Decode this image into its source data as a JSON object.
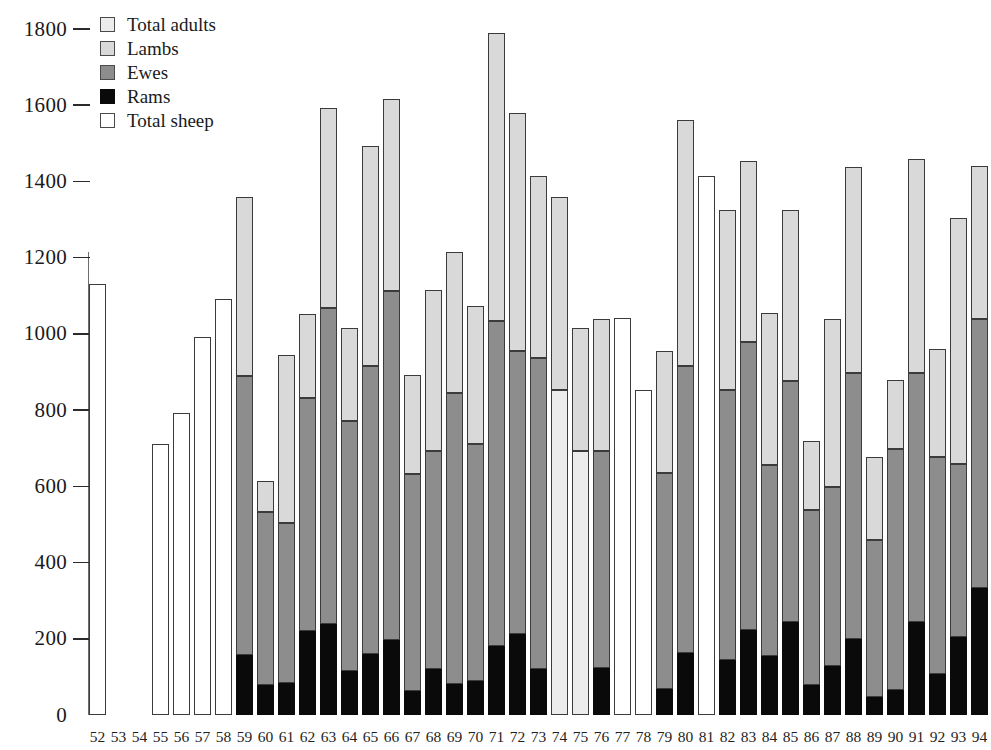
{
  "chart_data": {
    "type": "bar",
    "title": "",
    "subtitle": "",
    "xlabel": "",
    "ylabel": "",
    "ylim": [
      0,
      1800
    ],
    "ytick_step": 200,
    "yticks": [
      0,
      200,
      400,
      600,
      800,
      1000,
      1200,
      1400,
      1600,
      1800
    ],
    "ytick_labels": [
      "0",
      "200",
      "400",
      "600",
      "800",
      "1000",
      "1200",
      "1400",
      "1600",
      "1800"
    ],
    "grid": false,
    "stacked": true,
    "legend_position": "top-left",
    "legend": [
      {
        "key": "adults",
        "label": "Total adults",
        "color": "#ececec"
      },
      {
        "key": "lambs",
        "label": "Lambs",
        "color": "#d9d9d9"
      },
      {
        "key": "ewes",
        "label": "Ewes",
        "color": "#8d8d8d"
      },
      {
        "key": "rams",
        "label": "Rams",
        "color": "#0a0a0a"
      },
      {
        "key": "total",
        "label": "Total sheep",
        "color": "#ffffff"
      }
    ],
    "categories": [
      "52",
      "53",
      "54",
      "55",
      "56",
      "57",
      "58",
      "59",
      "60",
      "61",
      "62",
      "63",
      "64",
      "65",
      "66",
      "67",
      "68",
      "69",
      "70",
      "71",
      "72",
      "73",
      "74",
      "75",
      "76",
      "77",
      "78",
      "79",
      "80",
      "81",
      "82",
      "83",
      "84",
      "85",
      "86",
      "87",
      "88",
      "89",
      "90",
      "91",
      "92",
      "93",
      "94"
    ],
    "bars": [
      {
        "category": "52",
        "kind": "total",
        "segments": [
          {
            "key": "total",
            "from": 0,
            "to": 1130
          }
        ],
        "total": 1130
      },
      {
        "category": "53",
        "kind": "empty",
        "segments": [],
        "total": 0
      },
      {
        "category": "54",
        "kind": "empty",
        "segments": [],
        "total": 0
      },
      {
        "category": "55",
        "kind": "total",
        "segments": [
          {
            "key": "total",
            "from": 0,
            "to": 712
          }
        ],
        "total": 712
      },
      {
        "category": "56",
        "kind": "total",
        "segments": [
          {
            "key": "total",
            "from": 0,
            "to": 792
          }
        ],
        "total": 792
      },
      {
        "category": "57",
        "kind": "total",
        "segments": [
          {
            "key": "total",
            "from": 0,
            "to": 992
          }
        ],
        "total": 992
      },
      {
        "category": "58",
        "kind": "total",
        "segments": [
          {
            "key": "total",
            "from": 0,
            "to": 1092
          }
        ],
        "total": 1092
      },
      {
        "category": "59",
        "kind": "stacked",
        "segments": [
          {
            "key": "rams",
            "from": 0,
            "to": 158
          },
          {
            "key": "ewes",
            "from": 158,
            "to": 890
          },
          {
            "key": "lambs",
            "from": 890,
            "to": 1358
          }
        ],
        "total": 1358
      },
      {
        "category": "60",
        "kind": "stacked",
        "segments": [
          {
            "key": "rams",
            "from": 0,
            "to": 80
          },
          {
            "key": "ewes",
            "from": 80,
            "to": 532
          },
          {
            "key": "lambs",
            "from": 532,
            "to": 614
          }
        ],
        "total": 614
      },
      {
        "category": "61",
        "kind": "stacked",
        "segments": [
          {
            "key": "rams",
            "from": 0,
            "to": 84
          },
          {
            "key": "ewes",
            "from": 84,
            "to": 504
          },
          {
            "key": "lambs",
            "from": 504,
            "to": 944
          }
        ],
        "total": 944
      },
      {
        "category": "62",
        "kind": "stacked",
        "segments": [
          {
            "key": "rams",
            "from": 0,
            "to": 220
          },
          {
            "key": "ewes",
            "from": 220,
            "to": 832
          },
          {
            "key": "lambs",
            "from": 832,
            "to": 1052
          }
        ],
        "total": 1052
      },
      {
        "category": "63",
        "kind": "stacked",
        "segments": [
          {
            "key": "rams",
            "from": 0,
            "to": 240
          },
          {
            "key": "ewes",
            "from": 240,
            "to": 1068
          },
          {
            "key": "lambs",
            "from": 1068,
            "to": 1594
          }
        ],
        "total": 1594
      },
      {
        "category": "64",
        "kind": "stacked",
        "segments": [
          {
            "key": "rams",
            "from": 0,
            "to": 116
          },
          {
            "key": "ewes",
            "from": 116,
            "to": 772
          },
          {
            "key": "lambs",
            "from": 772,
            "to": 1016
          }
        ],
        "total": 1016
      },
      {
        "category": "65",
        "kind": "stacked",
        "segments": [
          {
            "key": "rams",
            "from": 0,
            "to": 160
          },
          {
            "key": "ewes",
            "from": 160,
            "to": 916
          },
          {
            "key": "lambs",
            "from": 916,
            "to": 1492
          }
        ],
        "total": 1492
      },
      {
        "category": "66",
        "kind": "stacked",
        "segments": [
          {
            "key": "rams",
            "from": 0,
            "to": 198
          },
          {
            "key": "ewes",
            "from": 198,
            "to": 1112
          },
          {
            "key": "lambs",
            "from": 1112,
            "to": 1616
          }
        ],
        "total": 1616
      },
      {
        "category": "67",
        "kind": "stacked",
        "segments": [
          {
            "key": "rams",
            "from": 0,
            "to": 64
          },
          {
            "key": "ewes",
            "from": 64,
            "to": 632
          },
          {
            "key": "lambs",
            "from": 632,
            "to": 892
          }
        ],
        "total": 892
      },
      {
        "category": "68",
        "kind": "stacked",
        "segments": [
          {
            "key": "rams",
            "from": 0,
            "to": 120
          },
          {
            "key": "ewes",
            "from": 120,
            "to": 694
          },
          {
            "key": "lambs",
            "from": 694,
            "to": 1116
          }
        ],
        "total": 1116
      },
      {
        "category": "69",
        "kind": "stacked",
        "segments": [
          {
            "key": "rams",
            "from": 0,
            "to": 82
          },
          {
            "key": "ewes",
            "from": 82,
            "to": 844
          },
          {
            "key": "lambs",
            "from": 844,
            "to": 1216
          }
        ],
        "total": 1216
      },
      {
        "category": "70",
        "kind": "stacked",
        "segments": [
          {
            "key": "rams",
            "from": 0,
            "to": 88
          },
          {
            "key": "ewes",
            "from": 88,
            "to": 712
          },
          {
            "key": "lambs",
            "from": 712,
            "to": 1074
          }
        ],
        "total": 1074
      },
      {
        "category": "71",
        "kind": "stacked",
        "segments": [
          {
            "key": "rams",
            "from": 0,
            "to": 180
          },
          {
            "key": "ewes",
            "from": 180,
            "to": 1034
          },
          {
            "key": "lambs",
            "from": 1034,
            "to": 1790
          }
        ],
        "total": 1790
      },
      {
        "category": "72",
        "kind": "stacked",
        "segments": [
          {
            "key": "rams",
            "from": 0,
            "to": 212
          },
          {
            "key": "ewes",
            "from": 212,
            "to": 956
          },
          {
            "key": "lambs",
            "from": 956,
            "to": 1580
          }
        ],
        "total": 1580
      },
      {
        "category": "73",
        "kind": "stacked",
        "segments": [
          {
            "key": "rams",
            "from": 0,
            "to": 122
          },
          {
            "key": "ewes",
            "from": 122,
            "to": 936
          },
          {
            "key": "lambs",
            "from": 936,
            "to": 1414
          }
        ],
        "total": 1414
      },
      {
        "category": "74",
        "kind": "stacked",
        "segments": [
          {
            "key": "adults",
            "from": 0,
            "to": 854
          },
          {
            "key": "lambs",
            "from": 854,
            "to": 1360
          }
        ],
        "total": 1360
      },
      {
        "category": "75",
        "kind": "stacked",
        "segments": [
          {
            "key": "adults",
            "from": 0,
            "to": 694
          },
          {
            "key": "lambs",
            "from": 694,
            "to": 1016
          }
        ],
        "total": 1016
      },
      {
        "category": "76",
        "kind": "stacked",
        "segments": [
          {
            "key": "rams",
            "from": 0,
            "to": 124
          },
          {
            "key": "ewes",
            "from": 124,
            "to": 694
          },
          {
            "key": "lambs",
            "from": 694,
            "to": 1038
          }
        ],
        "total": 1038
      },
      {
        "category": "77",
        "kind": "total",
        "segments": [
          {
            "key": "total",
            "from": 0,
            "to": 1042
          }
        ],
        "total": 1042
      },
      {
        "category": "78",
        "kind": "total",
        "segments": [
          {
            "key": "total",
            "from": 0,
            "to": 854
          }
        ],
        "total": 854
      },
      {
        "category": "79",
        "kind": "stacked",
        "segments": [
          {
            "key": "rams",
            "from": 0,
            "to": 68
          },
          {
            "key": "ewes",
            "from": 68,
            "to": 634
          },
          {
            "key": "lambs",
            "from": 634,
            "to": 956
          }
        ],
        "total": 956
      },
      {
        "category": "80",
        "kind": "stacked",
        "segments": [
          {
            "key": "rams",
            "from": 0,
            "to": 164
          },
          {
            "key": "ewes",
            "from": 164,
            "to": 916
          },
          {
            "key": "lambs",
            "from": 916,
            "to": 1560
          }
        ],
        "total": 1560
      },
      {
        "category": "81",
        "kind": "total",
        "segments": [
          {
            "key": "total",
            "from": 0,
            "to": 1414
          }
        ],
        "total": 1414
      },
      {
        "category": "82",
        "kind": "stacked",
        "segments": [
          {
            "key": "rams",
            "from": 0,
            "to": 144
          },
          {
            "key": "ewes",
            "from": 144,
            "to": 854
          },
          {
            "key": "lambs",
            "from": 854,
            "to": 1324
          }
        ],
        "total": 1324
      },
      {
        "category": "83",
        "kind": "stacked",
        "segments": [
          {
            "key": "rams",
            "from": 0,
            "to": 224
          },
          {
            "key": "ewes",
            "from": 224,
            "to": 978
          },
          {
            "key": "lambs",
            "from": 978,
            "to": 1454
          }
        ],
        "total": 1454
      },
      {
        "category": "84",
        "kind": "stacked",
        "segments": [
          {
            "key": "rams",
            "from": 0,
            "to": 154
          },
          {
            "key": "ewes",
            "from": 154,
            "to": 656
          },
          {
            "key": "lambs",
            "from": 656,
            "to": 1056
          }
        ],
        "total": 1056
      },
      {
        "category": "85",
        "kind": "stacked",
        "segments": [
          {
            "key": "rams",
            "from": 0,
            "to": 244
          },
          {
            "key": "ewes",
            "from": 244,
            "to": 876
          },
          {
            "key": "lambs",
            "from": 876,
            "to": 1324
          }
        ],
        "total": 1324
      },
      {
        "category": "86",
        "kind": "stacked",
        "segments": [
          {
            "key": "rams",
            "from": 0,
            "to": 78
          },
          {
            "key": "ewes",
            "from": 78,
            "to": 538
          },
          {
            "key": "lambs",
            "from": 538,
            "to": 718
          }
        ],
        "total": 718
      },
      {
        "category": "87",
        "kind": "stacked",
        "segments": [
          {
            "key": "rams",
            "from": 0,
            "to": 128
          },
          {
            "key": "ewes",
            "from": 128,
            "to": 598
          },
          {
            "key": "lambs",
            "from": 598,
            "to": 1038
          }
        ],
        "total": 1038
      },
      {
        "category": "88",
        "kind": "stacked",
        "segments": [
          {
            "key": "rams",
            "from": 0,
            "to": 200
          },
          {
            "key": "ewes",
            "from": 200,
            "to": 898
          },
          {
            "key": "lambs",
            "from": 898,
            "to": 1438
          }
        ],
        "total": 1438
      },
      {
        "category": "89",
        "kind": "stacked",
        "segments": [
          {
            "key": "rams",
            "from": 0,
            "to": 46
          },
          {
            "key": "ewes",
            "from": 46,
            "to": 460
          },
          {
            "key": "lambs",
            "from": 460,
            "to": 678
          }
        ],
        "total": 678
      },
      {
        "category": "90",
        "kind": "stacked",
        "segments": [
          {
            "key": "rams",
            "from": 0,
            "to": 66
          },
          {
            "key": "ewes",
            "from": 66,
            "to": 698
          },
          {
            "key": "lambs",
            "from": 698,
            "to": 880
          }
        ],
        "total": 880
      },
      {
        "category": "91",
        "kind": "stacked",
        "segments": [
          {
            "key": "rams",
            "from": 0,
            "to": 244
          },
          {
            "key": "ewes",
            "from": 244,
            "to": 898
          },
          {
            "key": "lambs",
            "from": 898,
            "to": 1458
          }
        ],
        "total": 1458
      },
      {
        "category": "92",
        "kind": "stacked",
        "segments": [
          {
            "key": "rams",
            "from": 0,
            "to": 108
          },
          {
            "key": "ewes",
            "from": 108,
            "to": 678
          },
          {
            "key": "lambs",
            "from": 678,
            "to": 960
          }
        ],
        "total": 960
      },
      {
        "category": "93",
        "kind": "stacked",
        "segments": [
          {
            "key": "rams",
            "from": 0,
            "to": 204
          },
          {
            "key": "ewes",
            "from": 204,
            "to": 658
          },
          {
            "key": "lambs",
            "from": 658,
            "to": 1304
          }
        ],
        "total": 1304
      },
      {
        "category": "94",
        "kind": "stacked",
        "segments": [
          {
            "key": "rams",
            "from": 0,
            "to": 334
          },
          {
            "key": "ewes",
            "from": 334,
            "to": 1040
          },
          {
            "key": "lambs",
            "from": 1040,
            "to": 1440
          }
        ],
        "total": 1440
      }
    ]
  }
}
